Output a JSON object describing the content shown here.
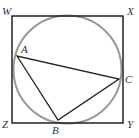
{
  "diagram": {
    "type": "geometry",
    "colors": {
      "square": "#222222",
      "circle": "#999999",
      "triangle": "#222222",
      "labels": "#333333"
    },
    "square": {
      "vertices": [
        {
          "name": "W",
          "x": 12,
          "y": 16,
          "label_x": 2,
          "label_y": 15
        },
        {
          "name": "X",
          "x": 123,
          "y": 16,
          "label_x": 127,
          "label_y": 15
        },
        {
          "name": "Y",
          "x": 123,
          "y": 123,
          "label_x": 127,
          "label_y": 128
        },
        {
          "name": "Z",
          "x": 12,
          "y": 123,
          "label_x": 2,
          "label_y": 128
        }
      ]
    },
    "circle": {
      "cx": 67.5,
      "cy": 69.5,
      "r": 54
    },
    "triangle": {
      "vertices": [
        {
          "name": "A",
          "x": 17,
          "y": 56,
          "label_x": 21,
          "label_y": 53
        },
        {
          "name": "B",
          "x": 58,
          "y": 120,
          "label_x": 52,
          "label_y": 134
        },
        {
          "name": "C",
          "x": 119,
          "y": 79,
          "label_x": 125,
          "label_y": 83
        }
      ]
    }
  }
}
